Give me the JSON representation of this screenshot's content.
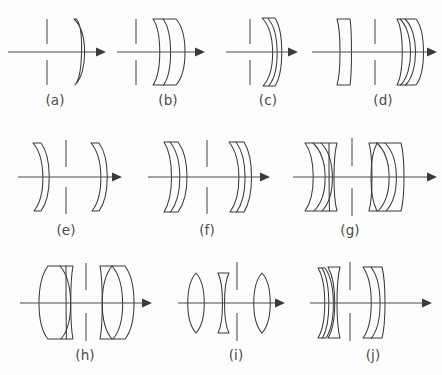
{
  "figure": {
    "background_color": "#fdfdfd",
    "line_color": "#3a3a3a",
    "stop_color": "#6d6d6d",
    "label_color": "#4b4b4b",
    "rows": 3,
    "columns": [
      4,
      3,
      3
    ]
  },
  "panels": [
    {
      "id": "a",
      "label": "(a)",
      "description": "Single meniscus lens behind aperture stop",
      "element_count": 1,
      "stop_position": "front",
      "label_x": 55,
      "label_y": 105,
      "axis": {
        "x1": 8,
        "x2": 103,
        "y": 52
      },
      "stop": {
        "x": 47,
        "y_top_1": 19,
        "y_top_2": 44,
        "y_bot_1": 60,
        "y_bot_2": 85
      }
    },
    {
      "id": "b",
      "label": "(b)",
      "description": "Cemented doublet, flat rear surface, behind stop",
      "element_count": 2,
      "stop_position": "front",
      "label_x": 168,
      "label_y": 105,
      "axis": {
        "x1": 117,
        "x2": 205,
        "y": 52
      },
      "stop": {
        "x": 136,
        "y_top_1": 19,
        "y_top_2": 44,
        "y_bot_1": 60,
        "y_bot_2": 85
      }
    },
    {
      "id": "c",
      "label": "(c)",
      "description": "Cemented meniscus doublet concave toward stop",
      "element_count": 2,
      "stop_position": "front",
      "label_x": 268,
      "label_y": 105,
      "axis": {
        "x1": 226,
        "x2": 298,
        "y": 52
      },
      "stop": {
        "x": 250,
        "y_top_1": 19,
        "y_top_2": 44,
        "y_bot_1": 60,
        "y_bot_2": 85
      }
    },
    {
      "id": "d",
      "label": "(d)",
      "description": "Meniscus front element, stop, cemented rear doublet",
      "element_count": 3,
      "stop_position": "middle",
      "label_x": 383,
      "label_y": 105,
      "axis": {
        "x1": 312,
        "x2": 437,
        "y": 52
      },
      "stop": {
        "x": 375,
        "y_top_1": 19,
        "y_top_2": 44,
        "y_bot_1": 60,
        "y_bot_2": 85
      }
    },
    {
      "id": "e",
      "label": "(e)",
      "description": "Two thin meniscus elements straddling central stop",
      "element_count": 2,
      "stop_position": "middle",
      "label_x": 66,
      "label_y": 235,
      "axis": {
        "x1": 18,
        "x2": 122,
        "y": 177
      },
      "stop": {
        "x": 66,
        "y_top_1": 140,
        "y_top_2": 167,
        "y_bot_1": 187,
        "y_bot_2": 214
      }
    },
    {
      "id": "f",
      "label": "(f)",
      "description": "Symmetric meniscus doublets around central stop",
      "element_count": 4,
      "stop_position": "middle",
      "label_x": 207,
      "label_y": 235,
      "axis": {
        "x1": 148,
        "x2": 270,
        "y": 177
      },
      "stop": {
        "x": 207,
        "y_top_1": 140,
        "y_top_2": 167,
        "y_bot_1": 187,
        "y_bot_2": 214
      }
    },
    {
      "id": "g",
      "label": "(g)",
      "description": "Double-Gauss: two cemented triplet groups about stop",
      "element_count": 6,
      "stop_position": "middle",
      "label_x": 350,
      "label_y": 235,
      "axis": {
        "x1": 293,
        "x2": 437,
        "y": 177
      },
      "stop": {
        "x": 352,
        "y_top_1": 138,
        "y_top_2": 166,
        "y_bot_1": 188,
        "y_bot_2": 216
      }
    },
    {
      "id": "h",
      "label": "(h)",
      "description": "Two cemented doublets of large aperture about stop",
      "element_count": 4,
      "stop_position": "middle",
      "label_x": 85,
      "label_y": 360,
      "axis": {
        "x1": 20,
        "x2": 152,
        "y": 303
      },
      "stop": {
        "x": 86,
        "y_top_1": 263,
        "y_top_2": 290,
        "y_bot_1": 313,
        "y_bot_2": 341
      }
    },
    {
      "id": "i",
      "label": "(i)",
      "description": "Cooke triplet: biconvex, biconcave, stop, biconvex",
      "element_count": 3,
      "stop_position": "rear-middle",
      "label_x": 236,
      "label_y": 360,
      "axis": {
        "x1": 178,
        "x2": 285,
        "y": 303
      },
      "stop": {
        "x": 237,
        "y_top_1": 262,
        "y_top_2": 290,
        "y_bot_1": 313,
        "y_bot_2": 341
      }
    },
    {
      "id": "j",
      "label": "(j)",
      "description": "Cemented front doublet plus meniscus, stop, rear doublet",
      "element_count": 4,
      "stop_position": "middle",
      "label_x": 373,
      "label_y": 360,
      "axis": {
        "x1": 310,
        "x2": 432,
        "y": 303
      },
      "stop": {
        "x": 350,
        "y_top_1": 262,
        "y_top_2": 290,
        "y_bot_1": 313,
        "y_bot_2": 341
      }
    }
  ]
}
